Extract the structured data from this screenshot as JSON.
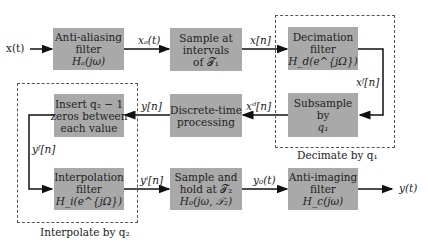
{
  "diagram": {
    "input_label": "x(t)",
    "output_label": "y(t)",
    "blocks": {
      "anti_aliasing": {
        "lines": [
          "Anti-aliasing",
          "filter",
          "Hₐ(jω)"
        ]
      },
      "sample": {
        "lines": [
          "Sample at",
          "intervals",
          "of 𝒯₁"
        ]
      },
      "decimation": {
        "lines": [
          "Decimation",
          "filter",
          "H_d(e^{jΩ})"
        ]
      },
      "subsample": {
        "lines": [
          "Subsample",
          "by",
          "q₁"
        ]
      },
      "dt_processing": {
        "lines": [
          "Discrete-time",
          "processing"
        ]
      },
      "insert_zeros": {
        "lines": [
          "Insert q₂ − 1",
          "zeros between",
          "each value"
        ]
      },
      "interpolation": {
        "lines": [
          "Interpolation",
          "filter",
          "H_i(e^{jΩ})"
        ]
      },
      "sample_hold": {
        "lines": [
          "Sample and",
          "hold at 𝒯₂",
          "H₀(jω, 𝒯₂)"
        ]
      },
      "anti_imaging": {
        "lines": [
          "Anti-imaging",
          "filter",
          "H_c(jω)"
        ]
      }
    },
    "signals": {
      "xa": "xₐ(t)",
      "xn": "x[n]",
      "xf": "xᶠ[n]",
      "xd": "xᵈ[n]",
      "yn": "y[n]",
      "yf": "yᶠ[n]",
      "yi": "yⁱ[n]",
      "yo": "y₀(t)"
    },
    "groups": {
      "decimate": "Decimate by q₁",
      "interpolate": "Interpolate by q₂"
    },
    "colors": {
      "block_fill": "#a9a9a9",
      "line": "#111111",
      "dash": "#555555"
    }
  }
}
